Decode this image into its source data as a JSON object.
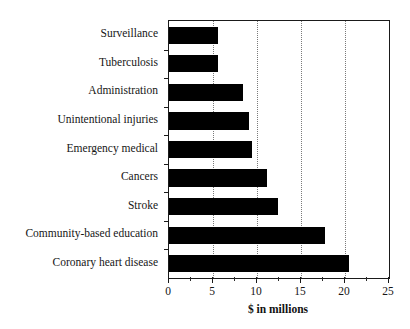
{
  "chart_data": {
    "type": "bar",
    "orientation": "horizontal",
    "title": "",
    "xlabel": "$ in millions",
    "ylabel": "",
    "xlim": [
      0,
      25
    ],
    "xticks": [
      0,
      5,
      10,
      15,
      20,
      25
    ],
    "xtick_labels": [
      "0",
      "5",
      "10",
      "15",
      "20",
      "25"
    ],
    "minor_tick_step": 2.5,
    "grid": "vertical-dotted",
    "legend": "none",
    "bar_color": "#000000",
    "categories": [
      "Surveillance",
      "Tuberculosis",
      "Administration",
      "Unintentional injuries",
      "Emergency medical",
      "Cancers",
      "Stroke",
      "Community-based education",
      "Coronary heart disease"
    ],
    "values": [
      5.6,
      5.6,
      8.4,
      9.1,
      9.4,
      11.1,
      12.4,
      17.7,
      20.4
    ]
  }
}
